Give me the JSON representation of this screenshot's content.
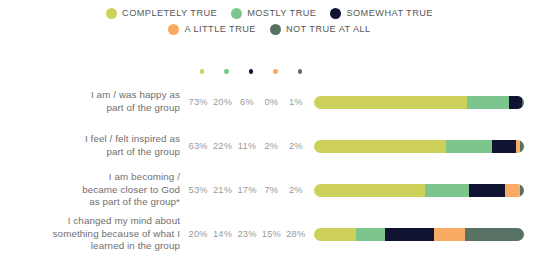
{
  "legend": {
    "lines": [
      [
        {
          "label": "COMPLETELY TRUE",
          "color": "#cdd159"
        },
        {
          "label": "MOSTLY TRUE",
          "color": "#7cc68d"
        },
        {
          "label": "SOMEWHAT TRUE",
          "color": "#111333"
        }
      ],
      [
        {
          "label": "A LITTLE TRUE",
          "color": "#f9ab63"
        },
        {
          "label": "NOT TRUE AT ALL",
          "color": "#577265"
        }
      ]
    ]
  },
  "chart_data": {
    "type": "bar",
    "title": "",
    "subtitle": "",
    "xlabel": "",
    "ylabel": "",
    "orientation": "horizontal",
    "stacked": true,
    "normalized_percent": true,
    "grid": false,
    "legend_position": "top",
    "xlim": [
      0,
      100
    ],
    "categories": [
      "I am / was happy as part of the group",
      "I feel / felt inspired as part of the group",
      "I am becoming / became closer to God as part of the group*",
      "I changed my mind about something because of what I learned in the group"
    ],
    "category_lines": [
      [
        "I am / was happy as",
        "part of the group"
      ],
      [
        "I feel / felt inspired as",
        "part of the group"
      ],
      [
        "I am becoming /",
        "became closer to God",
        "as part of the group*"
      ],
      [
        "I changed my mind about",
        "something because of what I",
        "learned in the group"
      ]
    ],
    "series": [
      {
        "name": "COMPLETELY TRUE",
        "color": "#cdd159",
        "values": [
          73,
          63,
          53,
          20
        ]
      },
      {
        "name": "MOSTLY TRUE",
        "color": "#7cc68d",
        "values": [
          20,
          22,
          21,
          14
        ]
      },
      {
        "name": "SOMEWHAT TRUE",
        "color": "#111333",
        "values": [
          6,
          11,
          17,
          23
        ]
      },
      {
        "name": "A LITTLE TRUE",
        "color": "#f9ab63",
        "values": [
          0,
          2,
          7,
          15
        ]
      },
      {
        "name": "NOT TRUE AT ALL",
        "color": "#577265",
        "values": [
          1,
          2,
          2,
          28
        ]
      }
    ],
    "value_labels": [
      [
        "73%",
        "20%",
        "6%",
        "0%",
        "1%"
      ],
      [
        "63%",
        "22%",
        "11%",
        "2%",
        "2%"
      ],
      [
        "53%",
        "21%",
        "17%",
        "7%",
        "2%"
      ],
      [
        "20%",
        "14%",
        "23%",
        "15%",
        "28%"
      ]
    ],
    "column_header_dots": [
      "#cdd159",
      "#7cc68d",
      "#111333",
      "#f9ab63",
      "#577265"
    ]
  }
}
